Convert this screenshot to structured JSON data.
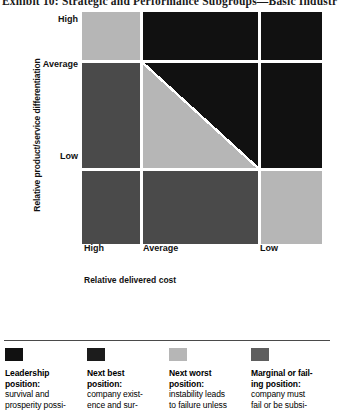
{
  "title": "Exhibit 10:   Strategic and Performance Subgroups—Basic Industr",
  "chart_data": {
    "type": "heatmap",
    "title": "Exhibit 10:   Strategic and Performance Subgroups—Basic Industr",
    "xlabel": "Relative delivered cost",
    "ylabel": "Relative product/service differentiation",
    "x_categories": [
      "High",
      "Average",
      "Low"
    ],
    "y_categories": [
      "High",
      "Average",
      "Low"
    ],
    "grid": true,
    "legend_position": "bottom",
    "cells": [
      {
        "row": "High",
        "col": "High",
        "category": "next-worst",
        "color": "#b6b6b6"
      },
      {
        "row": "High",
        "col": "Average",
        "category": "leadership",
        "color": "#111111"
      },
      {
        "row": "High",
        "col": "Low",
        "category": "leadership",
        "color": "#111111"
      },
      {
        "row": "Average",
        "col": "High",
        "category": "marginal",
        "color": "#4a4a4a"
      },
      {
        "row": "Average",
        "col": "Average",
        "category": "split",
        "color": "#b6b6b6",
        "color2": "#111111"
      },
      {
        "row": "Average",
        "col": "Low",
        "category": "leadership",
        "color": "#111111"
      },
      {
        "row": "Low",
        "col": "High",
        "category": "marginal",
        "color": "#4a4a4a"
      },
      {
        "row": "Low",
        "col": "Average",
        "category": "marginal",
        "color": "#4a4a4a"
      },
      {
        "row": "Low",
        "col": "Low",
        "category": "next-worst",
        "color": "#b6b6b6"
      }
    ],
    "legend": [
      {
        "color": "#111111",
        "head": "Leadership position:",
        "body": "survival and prosperity possi-"
      },
      {
        "color": "#1c1c1c",
        "head": "Next best position:",
        "body": "company exist- ence and sur-"
      },
      {
        "color": "#b6b6b6",
        "head": "Next worst position:",
        "body": "instability leads to failure unless"
      },
      {
        "color": "#5e5e5e",
        "head": "Marginal or fail- ing position:",
        "body": "company must fail or be subsi-"
      }
    ]
  },
  "axes": {
    "y_title": "Relative product/service differentiation",
    "x_title": "Relative delivered cost",
    "y_ticks": {
      "high": "High",
      "average": "Average",
      "low": "Low"
    },
    "x_ticks": {
      "high": "High",
      "average": "Average",
      "low": "Low"
    }
  },
  "legend": [
    {
      "head_line1": "Leadership",
      "head_line2": "position:",
      "body_line1": "survival and",
      "body_line2": "prosperity possi-"
    },
    {
      "head_line1": "Next best",
      "head_line2": "position:",
      "body_line1": "company exist-",
      "body_line2": "ence and sur-"
    },
    {
      "head_line1": "Next worst",
      "head_line2": "position:",
      "body_line1": "instability leads",
      "body_line2": "to failure unless"
    },
    {
      "head_line1": "Marginal or fail-",
      "head_line2": "ing position:",
      "body_line1": "company must",
      "body_line2": "fail or be subsi-"
    }
  ]
}
